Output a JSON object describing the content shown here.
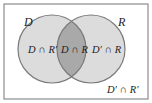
{
  "diagram": {
    "type": "venn",
    "sets": [
      {
        "name": "D",
        "label": "D"
      },
      {
        "name": "R",
        "label": "R"
      }
    ],
    "regions": {
      "d_only": "D ∩ R′",
      "both": "D ∩ R",
      "r_only": "D′ ∩ R",
      "neither": "D′ ∩ R′"
    },
    "colors": {
      "frame": "#777777",
      "circle_fill": "#dcdcdc",
      "circle_stroke": "#7a7a7a",
      "overlap_fill": "#a9a9a9",
      "background": "#ffffff"
    }
  }
}
